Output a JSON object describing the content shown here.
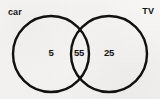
{
  "diagram": {
    "type": "venn",
    "background_color": "#f6f5f3",
    "stroke_color": "#111111",
    "text_color": "#141414",
    "sets": [
      {
        "id": "left",
        "label": "car",
        "center_x": 51,
        "center_y": 54,
        "radius": 38
      },
      {
        "id": "right",
        "label": "TV",
        "center_x": 109,
        "center_y": 54,
        "radius": 38
      }
    ],
    "regions": [
      {
        "id": "left-only",
        "set": "car",
        "value": "5"
      },
      {
        "id": "intersection",
        "set": "car and TV",
        "value": "55"
      },
      {
        "id": "right-only",
        "set": "TV",
        "value": "25"
      }
    ]
  }
}
